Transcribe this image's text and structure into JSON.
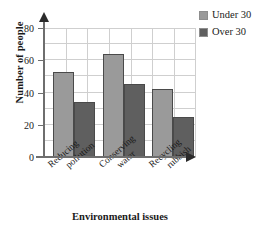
{
  "chart_data": {
    "type": "bar",
    "title": "",
    "xlabel": "Environmental issues",
    "ylabel": "Number of people",
    "categories": [
      "Reducing pollution",
      "Conserving water",
      "Recycling rubbish"
    ],
    "category_lines": [
      [
        "Reducing",
        "pollution"
      ],
      [
        "Conserving",
        "water"
      ],
      [
        "Recycling",
        "rubbish"
      ]
    ],
    "series": [
      {
        "name": "Under 30",
        "color": "#9a9a9a",
        "values": [
          53,
          64,
          42
        ]
      },
      {
        "name": "Over 30",
        "color": "#5f5f5f",
        "values": [
          34,
          45,
          25
        ]
      }
    ],
    "ylim": [
      0,
      80
    ],
    "ytick_labels": [
      "0",
      "20",
      "40",
      "60",
      "80"
    ],
    "ytick_values": [
      0,
      20,
      40,
      60,
      80
    ],
    "minor_tick_step": 10,
    "grid": true,
    "legend_position": "top-right",
    "legend_entries": [
      "Under 30",
      "Over 30"
    ]
  },
  "axes": {
    "y_title": "Number of people",
    "x_title": "Environmental issues"
  },
  "legend": {
    "items": [
      {
        "label": "Under 30",
        "color": "#9a9a9a"
      },
      {
        "label": "Over 30",
        "color": "#5f5f5f"
      }
    ]
  },
  "colors": {
    "series_under_30": "#9a9a9a",
    "series_over_30": "#5f5f5f",
    "grid": "#cfcfcf",
    "axis": "#6e6e6e",
    "text": "#1a1a1a",
    "background": "#ffffff"
  }
}
